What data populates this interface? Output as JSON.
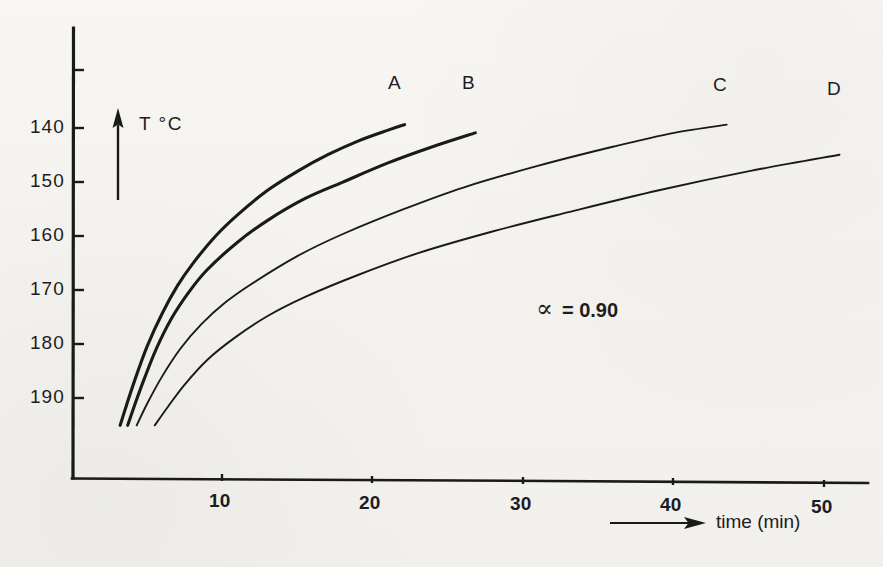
{
  "chart_data": {
    "type": "line",
    "title": "",
    "subtitle": "",
    "xlabel": "time (min)",
    "ylabel": "T °C",
    "xlim": [
      0,
      52
    ],
    "ylim": [
      195,
      128
    ],
    "y_axis_inverted": true,
    "grid": false,
    "legend_position": "curve-end-labels",
    "annotations": [
      {
        "text": "α = 0.90",
        "alpha_symbol": "α",
        "value_label": "= 0.90",
        "x": 33,
        "y": 172
      }
    ],
    "x_ticks": [
      10,
      20,
      30,
      40,
      50
    ],
    "x_tick_labels": [
      "10",
      "20",
      "30",
      "40",
      "50"
    ],
    "y_ticks": [
      130,
      140,
      150,
      160,
      170,
      180,
      190
    ],
    "y_tick_labels": [
      "",
      "140",
      "150",
      "160",
      "170",
      "180",
      "190"
    ],
    "series": [
      {
        "name": "A",
        "label": "A",
        "line_width": "thick",
        "x": [
          3.2,
          3.6,
          4.2,
          5.0,
          6.0,
          7.0,
          8.0,
          9.5,
          11.0,
          13.0,
          15.0,
          17.0,
          19.0,
          21.0,
          22.1
        ],
        "values": [
          195.0,
          191.5,
          186.5,
          180.5,
          174.5,
          169.5,
          165.5,
          160.5,
          156.5,
          152.0,
          148.5,
          145.5,
          143.0,
          141.0,
          140.0
        ]
      },
      {
        "name": "B",
        "label": "B",
        "line_width": "thick",
        "x": [
          3.7,
          4.2,
          4.8,
          5.6,
          6.6,
          7.8,
          9.0,
          11.0,
          13.0,
          15.5,
          18.0,
          21.0,
          24.0,
          26.8
        ],
        "values": [
          195.0,
          191.0,
          186.5,
          181.0,
          175.5,
          170.5,
          166.5,
          161.5,
          157.5,
          153.5,
          150.5,
          147.0,
          144.0,
          141.5
        ]
      },
      {
        "name": "C",
        "label": "C",
        "line_width": "thin",
        "x": [
          4.3,
          5.0,
          6.0,
          7.2,
          8.6,
          10.2,
          12.0,
          15.0,
          18.0,
          22.0,
          26.0,
          31.0,
          36.0,
          40.0,
          43.5
        ],
        "values": [
          195.0,
          191.0,
          186.0,
          181.0,
          176.5,
          172.5,
          169.0,
          164.0,
          160.0,
          155.5,
          151.5,
          147.5,
          144.0,
          141.5,
          140.0
        ]
      },
      {
        "name": "D",
        "label": "D",
        "line_width": "thin",
        "x": [
          5.5,
          6.4,
          7.5,
          9.0,
          10.8,
          13.0,
          15.5,
          19.0,
          23.0,
          28.0,
          33.0,
          39.0,
          45.0,
          51.0
        ],
        "values": [
          195.0,
          191.5,
          187.5,
          183.0,
          179.0,
          175.0,
          171.5,
          167.5,
          163.5,
          159.5,
          156.0,
          152.0,
          148.5,
          145.5
        ]
      }
    ]
  },
  "axis": {
    "y_title": "T °C",
    "x_title": "time (min)",
    "y_tick_140": "140",
    "y_tick_150": "150",
    "y_tick_160": "160",
    "y_tick_170": "170",
    "y_tick_180": "180",
    "y_tick_190": "190",
    "x_tick_10": "10",
    "x_tick_20": "20",
    "x_tick_30": "30",
    "x_tick_40": "40",
    "x_tick_50": "50"
  },
  "curve_labels": {
    "a": "A",
    "b": "B",
    "c": "C",
    "d": "D"
  },
  "annotation": {
    "alpha": "∝",
    "equals_value": "=  0.90"
  },
  "colors": {
    "ink": "#1a1a1a",
    "paper": "#f5f4f1"
  }
}
